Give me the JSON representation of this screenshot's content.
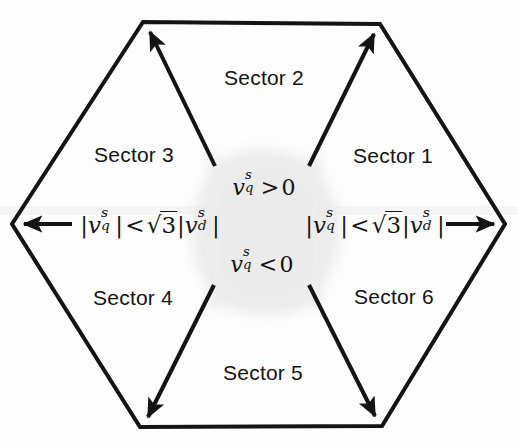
{
  "figure": {
    "background_color": "#fdfdfd",
    "stroke_color": "#141414",
    "text_color": "#141414",
    "smudge_color": "#e9e9e9"
  },
  "sectors": [
    {
      "id": "sector-1",
      "label": "Sector 1",
      "x": 393,
      "y": 156
    },
    {
      "id": "sector-2",
      "label": "Sector 2",
      "x": 264,
      "y": 78
    },
    {
      "id": "sector-3",
      "label": "Sector 3",
      "x": 134,
      "y": 155
    },
    {
      "id": "sector-4",
      "label": "Sector 4",
      "x": 133,
      "y": 298
    },
    {
      "id": "sector-5",
      "label": "Sector 5",
      "x": 263,
      "y": 373
    },
    {
      "id": "sector-6",
      "label": "Sector 6",
      "x": 394,
      "y": 297
    }
  ],
  "annotations": {
    "inequality_left": {
      "id": "inequality-left",
      "text": "|v_q^s| < sqrt(3)|v_d^s|",
      "plain": "|vqs| < √3|vds|",
      "x": 150,
      "y": 224
    },
    "inequality_right": {
      "id": "inequality-right",
      "text": "|v_q^s| < sqrt(3)|v_d^s|",
      "plain": "|vqs| < √3|vds|",
      "x": 375,
      "y": 224
    },
    "condition_upper": {
      "id": "condition-upper",
      "text": "v_q^s > 0",
      "plain": "vqs > 0",
      "x": 264,
      "y": 186
    },
    "condition_lower": {
      "id": "condition-lower",
      "text": "v_q^s < 0",
      "plain": "vqs < 0",
      "x": 262,
      "y": 263
    }
  },
  "geometry": {
    "center": {
      "x": 260,
      "y": 224
    },
    "vertices": [
      {
        "id": "vertex-left",
        "x": 12,
        "y": 224,
        "arrow": "left"
      },
      {
        "id": "vertex-top-left",
        "x": 143,
        "y": 22,
        "arrow": "up-left"
      },
      {
        "id": "vertex-top-right",
        "x": 380,
        "y": 24,
        "arrow": "up-right"
      },
      {
        "id": "vertex-right",
        "x": 505,
        "y": 224,
        "arrow": "right"
      },
      {
        "id": "vertex-bottom-right",
        "x": 382,
        "y": 426,
        "arrow": "down-right"
      },
      {
        "id": "vertex-bottom-left",
        "x": 140,
        "y": 427,
        "arrow": "down-left"
      }
    ],
    "hexagon_stroke_width": 4,
    "arrow_stroke_width": 4
  }
}
